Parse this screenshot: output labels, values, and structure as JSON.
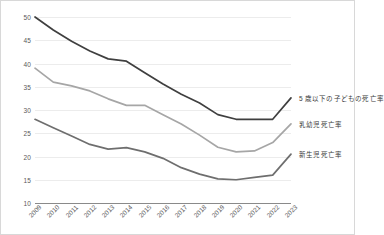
{
  "chart_data": {
    "type": "line",
    "title": "",
    "xlabel": "",
    "ylabel": "",
    "ylim": [
      10,
      50
    ],
    "yticks": [
      10,
      15,
      20,
      25,
      30,
      35,
      40,
      45,
      50
    ],
    "grid": true,
    "legend_position": "right-of-plot-inline",
    "categories": [
      "2009",
      "2010",
      "2011",
      "2012",
      "2013",
      "2014",
      "2015",
      "2016",
      "2017",
      "2018",
      "2019",
      "2020",
      "2021",
      "2022",
      "2023"
    ],
    "series": [
      {
        "name": "5歳以下の子どもの死亡率",
        "color": "#3f3f3f",
        "values": [
          50.0,
          47.2,
          44.8,
          42.7,
          41.0,
          40.5,
          38.0,
          35.6,
          33.4,
          31.5,
          29.0,
          28.0,
          28.0,
          28.0,
          32.6
        ]
      },
      {
        "name": "乳幼児死亡率",
        "color": "#a6a6a6",
        "values": [
          39.0,
          36.0,
          35.2,
          34.1,
          32.4,
          31.0,
          31.0,
          29.0,
          27.0,
          24.6,
          22.0,
          21.0,
          21.2,
          23.0,
          27.0
        ]
      },
      {
        "name": "新生児死亡率",
        "color": "#6e6e6e",
        "values": [
          28.0,
          26.2,
          24.4,
          22.6,
          21.6,
          21.9,
          21.0,
          19.6,
          17.6,
          16.2,
          15.2,
          15.0,
          15.5,
          16.0,
          20.5
        ]
      }
    ]
  },
  "axis": {
    "ytick_labels": [
      "50",
      "45",
      "40",
      "35",
      "30",
      "25",
      "20",
      "15",
      "10"
    ],
    "xtick_labels": [
      "2009",
      "2010",
      "2011",
      "2012",
      "2013",
      "2014",
      "2015",
      "2016",
      "2017",
      "2018",
      "2019",
      "2020",
      "2021",
      "2022",
      "2023"
    ]
  },
  "legend": {
    "items": [
      {
        "label": "5 歳以下の子どもの死亡率"
      },
      {
        "label": "乳幼児死亡率"
      },
      {
        "label": "新生児死亡率"
      }
    ]
  }
}
